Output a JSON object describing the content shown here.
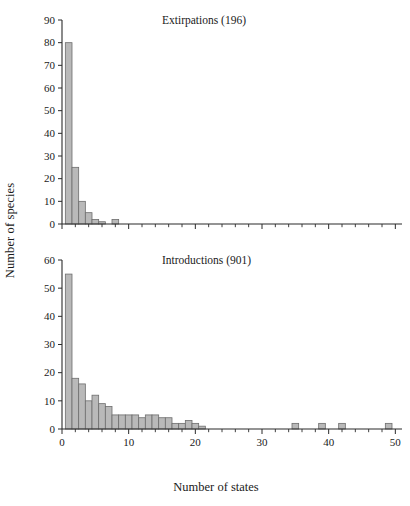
{
  "figure": {
    "shared_ylabel": "Number of species",
    "shared_xlabel": "Number of states",
    "bar_fill": "#b9b9b9",
    "bar_stroke": "#6d6d6d",
    "axis_color": "#2b2b2b",
    "background": "#ffffff"
  },
  "chart_data": [
    {
      "type": "bar",
      "title": "Extirpations (196)",
      "xlabel": "",
      "ylabel": "Number of species",
      "xlim": [
        0,
        51
      ],
      "ylim": [
        0,
        90
      ],
      "ytick_step": 10,
      "yticks": [
        0,
        10,
        20,
        30,
        40,
        50,
        60,
        70,
        80,
        90
      ],
      "ytick_labels": [
        "0",
        "10",
        "20",
        "30",
        "40",
        "50",
        "60",
        "70",
        "80",
        "90"
      ],
      "xticks_major": [
        0,
        10,
        20,
        30,
        40,
        50
      ],
      "xtick_labels": [
        "",
        "",
        "",
        "",
        "",
        ""
      ],
      "xtick_minor_step": 2,
      "grid": false,
      "legend": "none",
      "bar_width": 1,
      "x": [
        1,
        2,
        3,
        4,
        5,
        6,
        8
      ],
      "values": [
        80,
        25,
        10,
        5,
        2,
        1,
        2
      ]
    },
    {
      "type": "bar",
      "title": "Introductions (901)",
      "xlabel": "Number of states",
      "ylabel": "Number of species",
      "xlim": [
        0,
        51
      ],
      "ylim": [
        0,
        60
      ],
      "ytick_step": 10,
      "yticks": [
        0,
        10,
        20,
        30,
        40,
        50,
        60
      ],
      "ytick_labels": [
        "0",
        "10",
        "20",
        "30",
        "40",
        "50",
        "60"
      ],
      "xticks_major": [
        0,
        10,
        20,
        30,
        40,
        50
      ],
      "xtick_labels": [
        "0",
        "10",
        "20",
        "30",
        "40",
        "50"
      ],
      "xtick_minor_step": 2,
      "grid": false,
      "legend": "none",
      "bar_width": 1,
      "x": [
        1,
        2,
        3,
        4,
        5,
        6,
        7,
        8,
        9,
        10,
        11,
        12,
        13,
        14,
        15,
        16,
        17,
        18,
        19,
        20,
        21,
        35,
        39,
        42,
        49
      ],
      "values": [
        55,
        18,
        16,
        10,
        12,
        9,
        8,
        5,
        5,
        5,
        5,
        4,
        5,
        5,
        4,
        4,
        2,
        2,
        3,
        2,
        1,
        2,
        2,
        2,
        2
      ]
    }
  ]
}
